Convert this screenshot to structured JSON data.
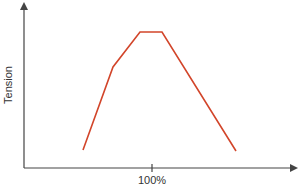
{
  "chart_data": {
    "type": "line",
    "title": "",
    "xlabel": "",
    "ylabel": "Tension",
    "x_ticks": [
      {
        "label": "100%",
        "position": 100
      }
    ],
    "series": [
      {
        "name": "Tension curve",
        "color": "#d2452a",
        "points": [
          {
            "x": 40,
            "y": 10
          },
          {
            "x": 70,
            "y": 73
          },
          {
            "x": 91,
            "y": 100
          },
          {
            "x": 109,
            "y": 100
          },
          {
            "x": 168,
            "y": 9
          }
        ]
      }
    ],
    "xlim": [
      0,
      200
    ],
    "ylim": [
      0,
      125
    ],
    "grid": false,
    "legend": null,
    "axis_color": "#444444",
    "y_ticks": []
  },
  "render": {
    "axis": {
      "x0": 24,
      "y0": 168,
      "x_end": 295,
      "y_top": 5
    },
    "polyline": "83,150 113,67 140,32 162,32 236,151",
    "tick_x": 152
  }
}
